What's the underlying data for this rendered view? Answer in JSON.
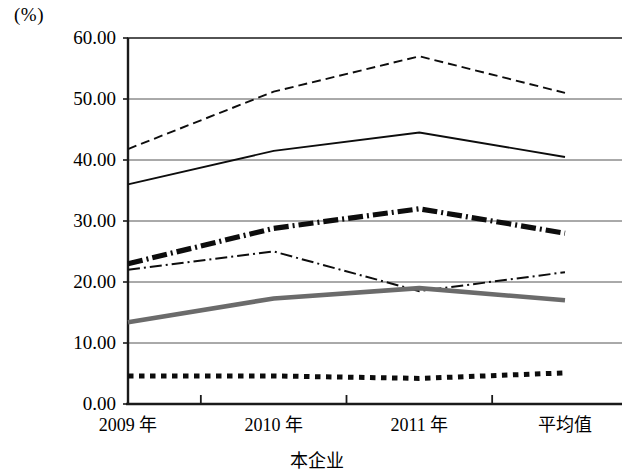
{
  "chart_data": {
    "type": "line",
    "title": "",
    "xlabel": "本企业",
    "ylabel": "(%)",
    "ylim": [
      0,
      60
    ],
    "ystep": 10,
    "grid": true,
    "legend": "none",
    "categories": [
      "2009 年",
      "2010 年",
      "2011 年",
      "平均值"
    ],
    "ytick_labels": [
      "60.00",
      "50.00",
      "40.00",
      "30.00",
      "20.00",
      "10.00",
      "0.00"
    ],
    "ytick_values": [
      60,
      50,
      40,
      30,
      20,
      10,
      0
    ],
    "series": [
      {
        "name": "series-1",
        "style": "thin-dashed",
        "values": [
          41.8,
          51.2,
          57.0,
          51.0
        ]
      },
      {
        "name": "series-2",
        "style": "thin-solid",
        "values": [
          36.0,
          41.5,
          44.5,
          40.5
        ]
      },
      {
        "name": "series-3",
        "style": "thick-dash-dot",
        "values": [
          23.0,
          28.8,
          32.0,
          28.0
        ]
      },
      {
        "name": "series-4",
        "style": "thin-dash-dot",
        "values": [
          22.0,
          25.0,
          18.5,
          21.6
        ]
      },
      {
        "name": "series-5",
        "style": "thick-gray-solid",
        "values": [
          13.4,
          17.3,
          19.0,
          17.0
        ]
      },
      {
        "name": "series-6",
        "style": "thick-dotted",
        "values": [
          4.6,
          4.6,
          4.2,
          5.1
        ]
      }
    ]
  },
  "colors": {
    "axis": "#1a1a1a",
    "grid": "#555555",
    "line_black": "#0d0d0d",
    "line_gray": "#6b6b6b",
    "background": "#ffffff"
  }
}
